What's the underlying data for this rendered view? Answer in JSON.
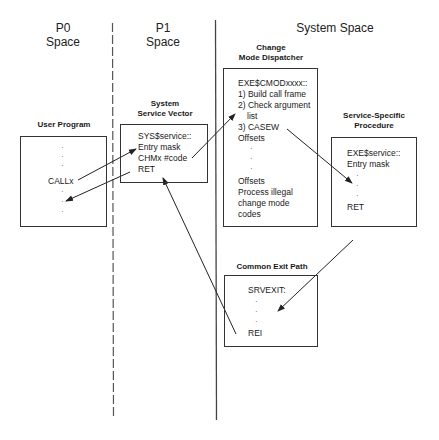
{
  "regions": {
    "p0": {
      "line1": "P0",
      "line2": "Space"
    },
    "p1": {
      "line1": "P1",
      "line2": "Space"
    },
    "system": {
      "label": "System Space"
    }
  },
  "boxes": {
    "user_program": {
      "title": "User Program",
      "call_label": "CALLx"
    },
    "system_service_vector": {
      "title_line1": "System",
      "title_line2": "Service Vector",
      "lines": [
        "SYS$service::",
        "Entry mask",
        "CHMx #code",
        "RET"
      ]
    },
    "change_mode_dispatcher": {
      "title_line1": "Change",
      "title_line2": "Mode Dispatcher",
      "lines": [
        "EXE$CMODxxxx::",
        "1) Build call frame",
        "2) Check argument",
        "list",
        "3) CASEW",
        "Offsets"
      ],
      "lines_bottom": [
        "Offsets",
        "Process illegal",
        "change mode",
        "codes"
      ]
    },
    "service_specific_procedure": {
      "title_line1": "Service-Specific",
      "title_line2": "Procedure",
      "lines": [
        "EXE$service::",
        "Entry mask"
      ],
      "ret": "RET"
    },
    "common_exit_path": {
      "title": "Common Exit Path",
      "label": "SRVEXIT:",
      "rei": "REI"
    }
  },
  "colors": {
    "line": "#333333",
    "text": "#1a1a1a",
    "background": "#ffffff"
  }
}
